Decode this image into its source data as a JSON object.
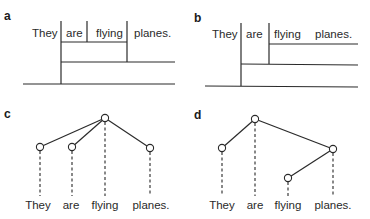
{
  "panels": {
    "a": {
      "label": "a",
      "type": "bracket-diagram",
      "words": [
        "They",
        "are",
        "flying",
        "planes."
      ]
    },
    "b": {
      "label": "b",
      "type": "bracket-diagram",
      "words": [
        "They",
        "are",
        "flying",
        "planes."
      ]
    },
    "c": {
      "label": "c",
      "type": "dependency-tree",
      "root": "flying",
      "words": [
        "They",
        "are",
        "flying",
        "planes."
      ],
      "edges": [
        [
          "flying",
          "They"
        ],
        [
          "flying",
          "are"
        ],
        [
          "flying",
          "planes."
        ]
      ]
    },
    "d": {
      "label": "d",
      "type": "dependency-tree",
      "root": "are",
      "words": [
        "They",
        "are",
        "flying",
        "planes."
      ],
      "edges": [
        [
          "are",
          "They"
        ],
        [
          "are",
          "planes."
        ],
        [
          "planes.",
          "flying"
        ]
      ]
    }
  },
  "colors": {
    "line": "#2a2a2a",
    "text": "#2a2a2a",
    "background": "#ffffff"
  }
}
